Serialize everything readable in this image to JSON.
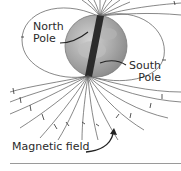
{
  "diagram": {
    "labels": {
      "north_line1": "North",
      "north_line2": "Pole",
      "south_line1": "South",
      "south_line2": "Pole",
      "field": "Magnetic field"
    },
    "colors": {
      "field_line": "#555555",
      "globe": "#9c9c9c",
      "globe_light": "#c8c8c8",
      "magnet": "#2b2b2b",
      "text": "#2a2a2a",
      "rule": "#9a9a9a"
    },
    "icons": {
      "field_arrow": "curved-arrow-icon",
      "pointer_north": "pointer-line",
      "pointer_south": "pointer-line"
    }
  }
}
